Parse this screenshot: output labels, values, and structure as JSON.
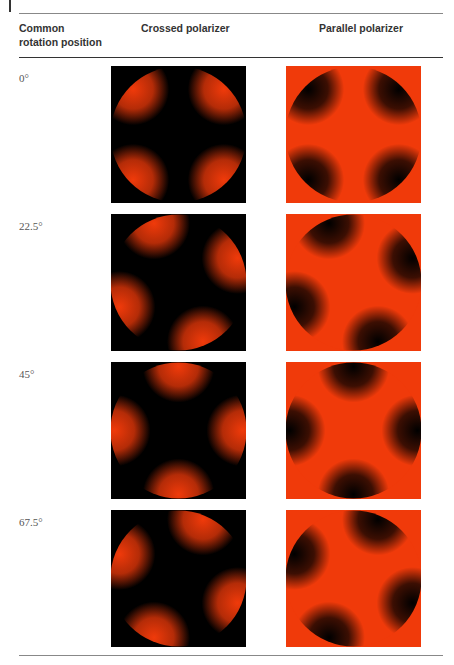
{
  "table": {
    "headers": {
      "col1_line1": "Common",
      "col1_line2": "rotation position",
      "col2": "Crossed polarizer",
      "col3": "Parallel polarizer"
    },
    "rows": [
      {
        "angle": "0°",
        "rotation_deg": 0,
        "crossed_image": "crossed-polarizer-0-deg",
        "parallel_image": "parallel-polarizer-0-deg"
      },
      {
        "angle": "22.5°",
        "rotation_deg": 22.5,
        "crossed_image": "crossed-polarizer-22.5-deg",
        "parallel_image": "parallel-polarizer-22.5-deg"
      },
      {
        "angle": "45°",
        "rotation_deg": 45,
        "crossed_image": "crossed-polarizer-45-deg",
        "parallel_image": "parallel-polarizer-45-deg"
      },
      {
        "angle": "67.5°",
        "rotation_deg": 67.5,
        "crossed_image": "crossed-polarizer-67.5-deg",
        "parallel_image": "parallel-polarizer-67.5-deg"
      }
    ]
  },
  "colors": {
    "red": "#f03a0a",
    "black": "#000000"
  }
}
